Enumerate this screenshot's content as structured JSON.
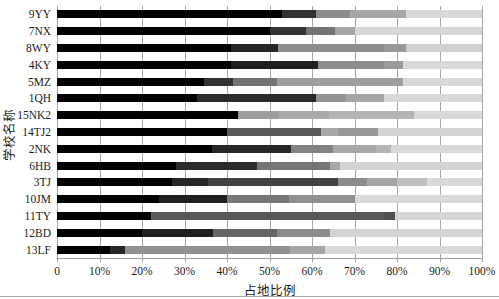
{
  "chart_data": {
    "type": "bar",
    "subtype": "horizontal-stacked-100pct",
    "title": "",
    "xlabel": "占地比例",
    "ylabel": "学校名称",
    "xlim": [
      0,
      100
    ],
    "grid": "vertical-on",
    "legend": "none",
    "grid_color": "#a8a8a8",
    "axis_color": "#9e9e9e",
    "x_ticks": [
      "0",
      "10%",
      "20%",
      "30%",
      "40%",
      "50%",
      "60%",
      "70%",
      "80%",
      "90%",
      "100%"
    ],
    "categories": [
      "9YY",
      "7NX",
      "8WY",
      "4KY",
      "5MZ",
      "1QH",
      "15NK2",
      "14TJ2",
      "2NK",
      "6HB",
      "3TJ",
      "10JM",
      "11TY",
      "12BD",
      "13LF"
    ],
    "rows": [
      {
        "name": "9YY",
        "segments": [
          {
            "to": 53,
            "color": "#000000"
          },
          {
            "to": 61,
            "color": "#333333"
          },
          {
            "to": 69,
            "color": "#8c8c8c"
          },
          {
            "to": 82,
            "color": "#a6a6a6"
          },
          {
            "to": 100,
            "color": "#d9d9d9"
          }
        ]
      },
      {
        "name": "7NX",
        "segments": [
          {
            "to": 50,
            "color": "#000000"
          },
          {
            "to": 58.5,
            "color": "#333333"
          },
          {
            "to": 65.5,
            "color": "#737373"
          },
          {
            "to": 70,
            "color": "#a6a6a6"
          },
          {
            "to": 100,
            "color": "#d6d6d6"
          }
        ]
      },
      {
        "name": "8WY",
        "segments": [
          {
            "to": 41,
            "color": "#000000"
          },
          {
            "to": 52,
            "color": "#262626"
          },
          {
            "to": 77,
            "color": "#8c8c8c"
          },
          {
            "to": 82,
            "color": "#999999"
          },
          {
            "to": 100,
            "color": "#cfcfcf"
          }
        ]
      },
      {
        "name": "4KY",
        "segments": [
          {
            "to": 41,
            "color": "#000000"
          },
          {
            "to": 61.5,
            "color": "#1f1f1f"
          },
          {
            "to": 77,
            "color": "#8c8c8c"
          },
          {
            "to": 81.5,
            "color": "#999999"
          },
          {
            "to": 100,
            "color": "#d9d9d9"
          }
        ]
      },
      {
        "name": "5MZ",
        "segments": [
          {
            "to": 34.5,
            "color": "#000000"
          },
          {
            "to": 41.5,
            "color": "#333333"
          },
          {
            "to": 51.7,
            "color": "#737373"
          },
          {
            "to": 81.5,
            "color": "#9e9e9e"
          },
          {
            "to": 100,
            "color": "#d9d9d9"
          }
        ]
      },
      {
        "name": "1QH",
        "segments": [
          {
            "to": 33,
            "color": "#000000"
          },
          {
            "to": 61,
            "color": "#2b2b2b"
          },
          {
            "to": 68,
            "color": "#949494"
          },
          {
            "to": 77,
            "color": "#a6a6a6"
          },
          {
            "to": 100,
            "color": "#d9d9d9"
          }
        ]
      },
      {
        "name": "15NK2",
        "segments": [
          {
            "to": 42.5,
            "color": "#000000"
          },
          {
            "to": 52,
            "color": "#9e9e9e"
          },
          {
            "to": 64,
            "color": "#a9a9a9"
          },
          {
            "to": 84,
            "color": "#b5b5b5"
          },
          {
            "to": 100,
            "color": "#d9d9d9"
          }
        ]
      },
      {
        "name": "14TJ2",
        "segments": [
          {
            "to": 40,
            "color": "#000000"
          },
          {
            "to": 62,
            "color": "#595959"
          },
          {
            "to": 66,
            "color": "#a8a8a8"
          },
          {
            "to": 75.5,
            "color": "#989898"
          },
          {
            "to": 100,
            "color": "#d4d4d4"
          }
        ]
      },
      {
        "name": "2NK",
        "segments": [
          {
            "to": 36.5,
            "color": "#000000"
          },
          {
            "to": 55,
            "color": "#262626"
          },
          {
            "to": 65,
            "color": "#828282"
          },
          {
            "to": 75,
            "color": "#a6a6a6"
          },
          {
            "to": 78.5,
            "color": "#b5b5b5"
          },
          {
            "to": 100,
            "color": "#d9d9d9"
          }
        ]
      },
      {
        "name": "6HB",
        "segments": [
          {
            "to": 28,
            "color": "#000000"
          },
          {
            "to": 47,
            "color": "#2b2b2b"
          },
          {
            "to": 64.3,
            "color": "#757575"
          },
          {
            "to": 66.5,
            "color": "#a6a6a6"
          },
          {
            "to": 100,
            "color": "#d4d4d4"
          }
        ]
      },
      {
        "name": "3TJ",
        "segments": [
          {
            "to": 27,
            "color": "#000000"
          },
          {
            "to": 35.5,
            "color": "#262626"
          },
          {
            "to": 66,
            "color": "#404040"
          },
          {
            "to": 73,
            "color": "#8c8c8c"
          },
          {
            "to": 80,
            "color": "#a6a6a6"
          },
          {
            "to": 87,
            "color": "#bfbfbf"
          },
          {
            "to": 100,
            "color": "#d9d9d9"
          }
        ]
      },
      {
        "name": "10JM",
        "segments": [
          {
            "to": 24,
            "color": "#000000"
          },
          {
            "to": 40,
            "color": "#1f1f1f"
          },
          {
            "to": 54.5,
            "color": "#787878"
          },
          {
            "to": 70,
            "color": "#909090"
          },
          {
            "to": 100,
            "color": "#d9d9d9"
          }
        ]
      },
      {
        "name": "11TY",
        "segments": [
          {
            "to": 22,
            "color": "#000000"
          },
          {
            "to": 77,
            "color": "#595959"
          },
          {
            "to": 79.5,
            "color": "#4f4f4f"
          },
          {
            "to": 100,
            "color": "#d6d6d6"
          }
        ]
      },
      {
        "name": "12BD",
        "segments": [
          {
            "to": 20,
            "color": "#000000"
          },
          {
            "to": 36.7,
            "color": "#1f1f1f"
          },
          {
            "to": 51.7,
            "color": "#666666"
          },
          {
            "to": 64.3,
            "color": "#8c8c8c"
          },
          {
            "to": 100,
            "color": "#d4d4d4"
          }
        ]
      },
      {
        "name": "13LF",
        "segments": [
          {
            "to": 12.5,
            "color": "#000000"
          },
          {
            "to": 16,
            "color": "#262626"
          },
          {
            "to": 54.8,
            "color": "#919191"
          },
          {
            "to": 63,
            "color": "#a6a6a6"
          },
          {
            "to": 100,
            "color": "#d9d9d9"
          }
        ]
      }
    ]
  }
}
